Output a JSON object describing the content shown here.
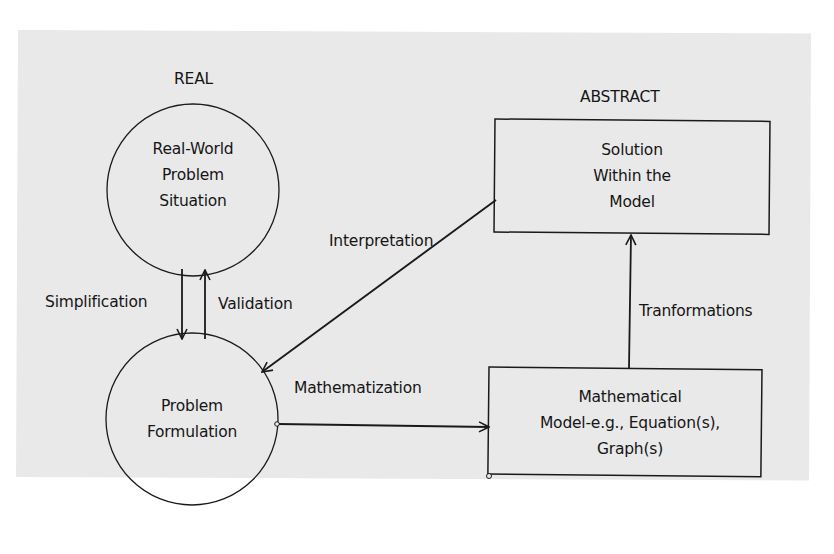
{
  "diagram": {
    "headings": {
      "real": "REAL",
      "abstract": "ABSTRACT"
    },
    "nodes": {
      "real_world": {
        "shape": "circle",
        "lines": [
          "Real-World",
          "Problem",
          "Situation"
        ]
      },
      "problem_formulation": {
        "shape": "circle",
        "lines": [
          "Problem",
          "Formulation"
        ]
      },
      "solution": {
        "shape": "rectangle",
        "lines": [
          "Solution",
          "Within the",
          "Model"
        ]
      },
      "math_model": {
        "shape": "rectangle",
        "lines": [
          "Mathematical",
          "Model-e.g., Equation(s),",
          "Graph(s)"
        ]
      }
    },
    "edges": {
      "simplification": {
        "label": "Simplification",
        "from": "Real-World Problem Situation",
        "to": "Problem Formulation"
      },
      "validation": {
        "label": "Validation",
        "from": "Problem Formulation",
        "to": "Real-World Problem Situation"
      },
      "mathematization": {
        "label": "Mathematization",
        "from": "Problem Formulation",
        "to": "Mathematical Model"
      },
      "transformations": {
        "label": "Tranformations",
        "from": "Mathematical Model",
        "to": "Solution Within the Model"
      },
      "interpretation": {
        "label": "Interpretation",
        "from": "Solution Within the Model",
        "to": "Problem Formulation"
      }
    },
    "colors": {
      "background": "#e9e9e9",
      "stroke": "#1a1a1a",
      "text": "#151515"
    }
  }
}
